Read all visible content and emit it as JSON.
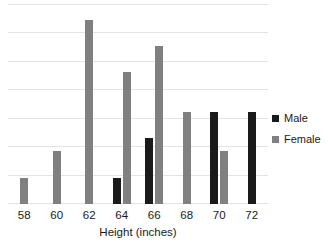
{
  "chart_data": {
    "type": "bar",
    "title": "",
    "subtitle": "",
    "xlabel": "Height (inches)",
    "ylabel": "",
    "categories": [
      "58",
      "60",
      "62",
      "64",
      "66",
      "68",
      "70",
      "72"
    ],
    "series": [
      {
        "name": "Male",
        "color": "#1a1a1a",
        "values": [
          0,
          0,
          0,
          1,
          2.5,
          0,
          3.5,
          3.5
        ]
      },
      {
        "name": "Female",
        "color": "#808080",
        "values": [
          1,
          2,
          7,
          5,
          6,
          3.5,
          2,
          0
        ]
      }
    ],
    "ylim": [
      0,
      7.6
    ],
    "grid": true,
    "gridline_count": 8,
    "y_axis_visible": false,
    "legend_position": "right"
  },
  "legend": {
    "items": [
      {
        "label": "Male",
        "color": "#1a1a1a",
        "swatch": "square-swatch"
      },
      {
        "label": "Female",
        "color": "#808080",
        "swatch": "square-swatch"
      }
    ]
  },
  "axis": {
    "x_title": "Height (inches)",
    "x_ticks": [
      "58",
      "60",
      "62",
      "64",
      "66",
      "68",
      "70",
      "72"
    ]
  },
  "colors": {
    "male": "#1a1a1a",
    "female": "#808080",
    "gridline": "#e3e3e3",
    "background": "#ffffff",
    "text": "#1a1a1a"
  }
}
